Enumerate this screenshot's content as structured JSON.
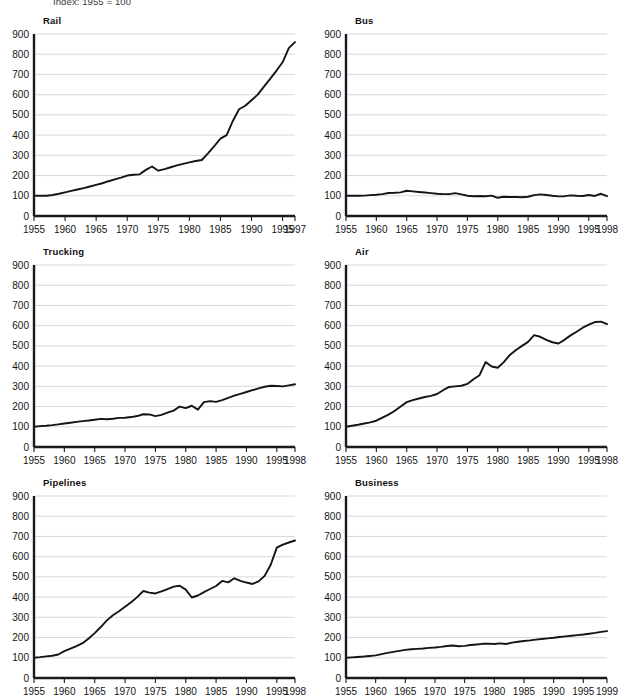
{
  "header": {
    "note": "Index: 1955 = 100"
  },
  "layout": {
    "columns": 2,
    "rows": 3,
    "panel_width": 311,
    "panel_height": 232
  },
  "axis": {
    "y_ticks": [
      0,
      100,
      200,
      300,
      400,
      500,
      600,
      700,
      800,
      900
    ],
    "y_min": 0,
    "y_max": 900,
    "x_ticks": [
      1955,
      1960,
      1965,
      1970,
      1975,
      1980,
      1985,
      1990,
      1995
    ],
    "gridline_color": "#c9c9cf",
    "line_color": "#141414",
    "spine_color": "#1a1a1a"
  },
  "chart_data": [
    {
      "type": "line",
      "title": "Rail",
      "xlabel": "",
      "ylabel": "",
      "ylim": [
        0,
        900
      ],
      "xlim": [
        1955,
        1997
      ],
      "x_end_label": "1997",
      "grid": true,
      "legend": "none",
      "x": [
        1955,
        1956,
        1957,
        1958,
        1959,
        1960,
        1961,
        1962,
        1963,
        1964,
        1965,
        1966,
        1967,
        1968,
        1969,
        1970,
        1971,
        1972,
        1973,
        1974,
        1975,
        1976,
        1977,
        1978,
        1979,
        1980,
        1981,
        1982,
        1983,
        1984,
        1985,
        1986,
        1987,
        1988,
        1989,
        1990,
        1991,
        1992,
        1993,
        1994,
        1995,
        1996,
        1997
      ],
      "values": [
        100,
        101,
        100,
        104,
        110,
        117,
        124,
        131,
        138,
        146,
        154,
        162,
        172,
        181,
        190,
        200,
        204,
        206,
        228,
        245,
        224,
        232,
        241,
        250,
        258,
        265,
        272,
        277,
        310,
        345,
        383,
        400,
        470,
        528,
        545,
        572,
        600,
        640,
        678,
        718,
        760,
        830,
        860
      ]
    },
    {
      "type": "line",
      "title": "Bus",
      "xlabel": "",
      "ylabel": "",
      "ylim": [
        0,
        900
      ],
      "xlim": [
        1955,
        1998
      ],
      "x_end_label": "1998",
      "grid": true,
      "legend": "none",
      "x": [
        1955,
        1956,
        1957,
        1958,
        1959,
        1960,
        1961,
        1962,
        1963,
        1964,
        1965,
        1966,
        1967,
        1968,
        1969,
        1970,
        1971,
        1972,
        1973,
        1974,
        1975,
        1976,
        1977,
        1978,
        1979,
        1980,
        1981,
        1982,
        1983,
        1984,
        1985,
        1986,
        1987,
        1988,
        1989,
        1990,
        1991,
        1992,
        1993,
        1994,
        1995,
        1996,
        1997,
        1998
      ],
      "values": [
        100,
        100,
        100,
        101,
        103,
        105,
        108,
        114,
        115,
        117,
        125,
        122,
        119,
        116,
        113,
        110,
        108,
        108,
        113,
        107,
        100,
        98,
        99,
        98,
        101,
        90,
        95,
        94,
        94,
        93,
        95,
        103,
        107,
        104,
        100,
        97,
        98,
        102,
        100,
        99,
        104,
        99,
        110,
        98
      ]
    },
    {
      "type": "line",
      "title": "Trucking",
      "xlabel": "",
      "ylabel": "",
      "ylim": [
        0,
        900
      ],
      "xlim": [
        1955,
        1998
      ],
      "x_end_label": "1998",
      "grid": true,
      "legend": "none",
      "x": [
        1955,
        1956,
        1957,
        1958,
        1959,
        1960,
        1961,
        1962,
        1963,
        1964,
        1965,
        1966,
        1967,
        1968,
        1969,
        1970,
        1971,
        1972,
        1973,
        1974,
        1975,
        1976,
        1977,
        1978,
        1979,
        1980,
        1981,
        1982,
        1983,
        1984,
        1985,
        1986,
        1987,
        1988,
        1989,
        1990,
        1991,
        1992,
        1993,
        1994,
        1995,
        1996,
        1997,
        1998
      ],
      "values": [
        100,
        103,
        105,
        108,
        112,
        116,
        120,
        124,
        128,
        131,
        135,
        139,
        137,
        140,
        144,
        145,
        148,
        153,
        162,
        161,
        153,
        159,
        170,
        180,
        200,
        192,
        204,
        185,
        222,
        227,
        223,
        232,
        243,
        254,
        263,
        272,
        281,
        290,
        298,
        303,
        302,
        300,
        305,
        310
      ]
    },
    {
      "type": "line",
      "title": "Air",
      "xlabel": "",
      "ylabel": "",
      "ylim": [
        0,
        900
      ],
      "xlim": [
        1955,
        1998
      ],
      "x_end_label": "1998",
      "grid": true,
      "legend": "none",
      "x": [
        1955,
        1956,
        1957,
        1958,
        1959,
        1960,
        1961,
        1962,
        1963,
        1964,
        1965,
        1966,
        1967,
        1968,
        1969,
        1970,
        1971,
        1972,
        1973,
        1974,
        1975,
        1976,
        1977,
        1978,
        1979,
        1980,
        1981,
        1982,
        1983,
        1984,
        1985,
        1986,
        1987,
        1988,
        1989,
        1990,
        1991,
        1992,
        1993,
        1994,
        1995,
        1996,
        1997,
        1998
      ],
      "values": [
        100,
        105,
        110,
        116,
        122,
        130,
        145,
        160,
        178,
        200,
        222,
        232,
        240,
        247,
        253,
        262,
        281,
        297,
        300,
        303,
        312,
        335,
        355,
        420,
        398,
        392,
        420,
        455,
        480,
        500,
        520,
        553,
        545,
        530,
        518,
        512,
        530,
        552,
        570,
        590,
        605,
        618,
        620,
        608
      ]
    },
    {
      "type": "line",
      "title": "Pipelines",
      "xlabel": "",
      "ylabel": "",
      "ylim": [
        0,
        900
      ],
      "xlim": [
        1955,
        1998
      ],
      "x_end_label": "1998",
      "grid": true,
      "legend": "none",
      "x": [
        1955,
        1956,
        1957,
        1958,
        1959,
        1960,
        1961,
        1962,
        1963,
        1964,
        1965,
        1966,
        1967,
        1968,
        1969,
        1970,
        1971,
        1972,
        1973,
        1974,
        1975,
        1976,
        1977,
        1978,
        1979,
        1980,
        1981,
        1982,
        1983,
        1984,
        1985,
        1986,
        1987,
        1988,
        1989,
        1990,
        1991,
        1992,
        1993,
        1994,
        1995,
        1996,
        1997,
        1998
      ],
      "values": [
        100,
        103,
        107,
        110,
        116,
        133,
        145,
        158,
        172,
        195,
        222,
        252,
        285,
        310,
        330,
        352,
        375,
        400,
        430,
        422,
        418,
        428,
        440,
        452,
        456,
        437,
        398,
        408,
        425,
        440,
        455,
        480,
        473,
        493,
        480,
        472,
        465,
        478,
        505,
        560,
        645,
        660,
        670,
        680
      ]
    },
    {
      "type": "line",
      "title": "Business",
      "xlabel": "",
      "ylabel": "",
      "ylim": [
        0,
        900
      ],
      "xlim": [
        1955,
        1999
      ],
      "x_end_label": "1999",
      "grid": true,
      "legend": "none",
      "x": [
        1955,
        1956,
        1957,
        1958,
        1959,
        1960,
        1961,
        1962,
        1963,
        1964,
        1965,
        1966,
        1967,
        1968,
        1969,
        1970,
        1971,
        1972,
        1973,
        1974,
        1975,
        1976,
        1977,
        1978,
        1979,
        1980,
        1981,
        1982,
        1983,
        1984,
        1985,
        1986,
        1987,
        1988,
        1989,
        1990,
        1991,
        1992,
        1993,
        1994,
        1995,
        1996,
        1997,
        1998,
        1999
      ],
      "values": [
        100,
        102,
        104,
        106,
        109,
        112,
        118,
        124,
        129,
        134,
        139,
        142,
        144,
        146,
        149,
        151,
        154,
        158,
        161,
        157,
        159,
        163,
        166,
        169,
        170,
        168,
        171,
        168,
        175,
        179,
        183,
        186,
        190,
        193,
        196,
        199,
        203,
        206,
        209,
        212,
        215,
        219,
        223,
        228,
        232
      ]
    }
  ]
}
